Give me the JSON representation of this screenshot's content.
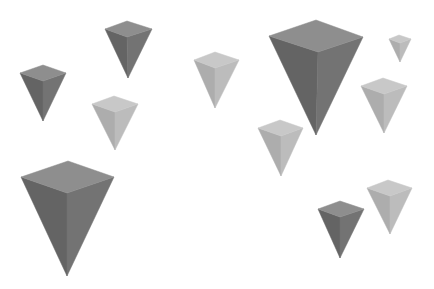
{
  "scene": {
    "width": 434,
    "height": 289,
    "background": "#ffffff",
    "description": "Eleven inverted square pyramids floating on white background, two shade tones",
    "palettes": {
      "dark": {
        "top": "#8e8e8e",
        "left": "#646464",
        "right": "#737373"
      },
      "light": {
        "top": "#c8c8c8",
        "left": "#adadad",
        "right": "#bcbcbc"
      }
    },
    "pyramids": [
      {
        "id": "pyramid-1",
        "tone": "dark",
        "left": [
          20,
          73
        ],
        "back": [
          43,
          65
        ],
        "right": [
          66,
          73
        ],
        "front": [
          43,
          81
        ],
        "apex": [
          43,
          121
        ]
      },
      {
        "id": "pyramid-2",
        "tone": "dark",
        "left": [
          105,
          29
        ],
        "back": [
          127,
          21
        ],
        "right": [
          152,
          29
        ],
        "front": [
          127,
          37
        ],
        "apex": [
          128,
          78
        ]
      },
      {
        "id": "pyramid-3",
        "tone": "light",
        "left": [
          92,
          104
        ],
        "back": [
          114,
          96
        ],
        "right": [
          138,
          104
        ],
        "front": [
          115,
          112
        ],
        "apex": [
          115,
          150
        ]
      },
      {
        "id": "pyramid-4",
        "tone": "light",
        "left": [
          194,
          60
        ],
        "back": [
          215,
          52
        ],
        "right": [
          239,
          60
        ],
        "front": [
          215,
          68
        ],
        "apex": [
          215,
          108
        ]
      },
      {
        "id": "pyramid-5",
        "tone": "dark",
        "left": [
          269,
          36
        ],
        "back": [
          316,
          20
        ],
        "right": [
          363,
          37
        ],
        "front": [
          318,
          52
        ],
        "apex": [
          316,
          135
        ]
      },
      {
        "id": "pyramid-6",
        "tone": "light",
        "left": [
          389,
          39
        ],
        "back": [
          399,
          35
        ],
        "right": [
          411,
          39
        ],
        "front": [
          400,
          43
        ],
        "apex": [
          400,
          62
        ]
      },
      {
        "id": "pyramid-7",
        "tone": "light",
        "left": [
          361,
          86
        ],
        "back": [
          383,
          78
        ],
        "right": [
          407,
          86
        ],
        "front": [
          384,
          94
        ],
        "apex": [
          384,
          133
        ]
      },
      {
        "id": "pyramid-8",
        "tone": "light",
        "left": [
          258,
          128
        ],
        "back": [
          280,
          120
        ],
        "right": [
          303,
          128
        ],
        "front": [
          281,
          136
        ],
        "apex": [
          281,
          176
        ]
      },
      {
        "id": "pyramid-9",
        "tone": "dark",
        "left": [
          21,
          177
        ],
        "back": [
          68,
          161
        ],
        "right": [
          114,
          177
        ],
        "front": [
          67,
          193
        ],
        "apex": [
          67,
          276
        ]
      },
      {
        "id": "pyramid-10",
        "tone": "dark",
        "left": [
          318,
          209
        ],
        "back": [
          340,
          201
        ],
        "right": [
          364,
          209
        ],
        "front": [
          340,
          217
        ],
        "apex": [
          340,
          258
        ]
      },
      {
        "id": "pyramid-11",
        "tone": "light",
        "left": [
          367,
          188
        ],
        "back": [
          388,
          180
        ],
        "right": [
          412,
          188
        ],
        "front": [
          390,
          196
        ],
        "apex": [
          390,
          234
        ]
      }
    ]
  }
}
